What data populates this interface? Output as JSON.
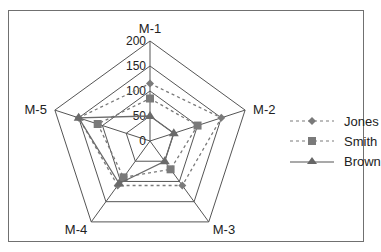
{
  "chart_data": {
    "type": "radar",
    "title": "",
    "categories": [
      "M-1",
      "M-2",
      "M-3",
      "M-4",
      "M-5"
    ],
    "radial_ticks": [
      0,
      50,
      100,
      150,
      200
    ],
    "rlim": [
      0,
      200
    ],
    "grid": true,
    "legend_position": "right",
    "series": [
      {
        "name": "Jones",
        "marker": "diamond",
        "line": "dashed",
        "color": "#7a7a7a",
        "values": [
          115,
          150,
          110,
          110,
          150
        ]
      },
      {
        "name": "Smith",
        "marker": "square",
        "line": "dashed",
        "color": "#7a7a7a",
        "values": [
          85,
          100,
          70,
          90,
          110
        ]
      },
      {
        "name": "Brown",
        "marker": "triangle",
        "line": "solid",
        "color": "#6a6a6a",
        "values": [
          50,
          50,
          50,
          105,
          150
        ]
      }
    ]
  },
  "legend": {
    "items": [
      {
        "label": "Jones"
      },
      {
        "label": "Smith"
      },
      {
        "label": "Brown"
      }
    ]
  }
}
